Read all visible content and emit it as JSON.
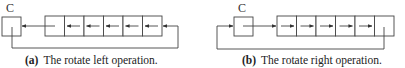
{
  "figure": {
    "left": {
      "carry_label": "C",
      "cells": 6,
      "direction": "left",
      "caption_prefix": "(a)",
      "caption_text": "The rotate left operation."
    },
    "right": {
      "carry_label": "C",
      "cells": 6,
      "direction": "right",
      "caption_prefix": "(b)",
      "caption_text": "The rotate right operation."
    },
    "colors": {
      "line": "#444444",
      "text": "#222222",
      "background": "#ffffff"
    }
  }
}
